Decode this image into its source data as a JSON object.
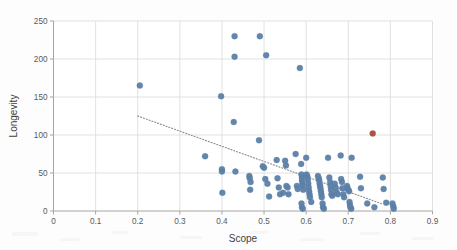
{
  "chart_data": {
    "type": "scatter",
    "title": "",
    "xlabel": "Scope",
    "ylabel": "Longevity",
    "xlim": [
      0,
      0.9
    ],
    "ylim": [
      0,
      250
    ],
    "xticks": [
      0,
      0.1,
      0.2,
      0.3,
      0.4,
      0.5,
      0.6,
      0.7,
      0.8,
      0.9
    ],
    "xtick_labels": [
      "0",
      "0.1",
      "0.2",
      "0.3",
      "0.4",
      "0.5",
      "0.6",
      "0.7",
      "0.8",
      "0.9"
    ],
    "yticks": [
      0,
      50,
      100,
      150,
      200,
      250
    ],
    "ytick_labels": [
      "0",
      "50",
      "100",
      "150",
      "200",
      "250"
    ],
    "grid": true,
    "legend": "none",
    "marker_color": "#5b7fa8",
    "highlight_color": "#a84b3c",
    "trendline": {
      "style": "dotted",
      "color": "#8a8a8a",
      "x_start": 0.2,
      "y_start": 125,
      "x_end": 0.782,
      "y_end": 9
    },
    "series": [
      {
        "name": "observations",
        "color": "#5b7fa8",
        "points": [
          [
            0.205,
            165
          ],
          [
            0.36,
            72
          ],
          [
            0.398,
            151
          ],
          [
            0.4,
            55
          ],
          [
            0.4,
            52
          ],
          [
            0.401,
            24
          ],
          [
            0.43,
            230
          ],
          [
            0.43,
            203
          ],
          [
            0.428,
            117
          ],
          [
            0.432,
            52
          ],
          [
            0.465,
            46
          ],
          [
            0.466,
            43
          ],
          [
            0.468,
            38
          ],
          [
            0.467,
            28
          ],
          [
            0.49,
            230
          ],
          [
            0.488,
            93
          ],
          [
            0.497,
            59
          ],
          [
            0.5,
            57
          ],
          [
            0.505,
            205
          ],
          [
            0.503,
            42
          ],
          [
            0.508,
            36
          ],
          [
            0.512,
            19
          ],
          [
            0.53,
            67
          ],
          [
            0.532,
            43
          ],
          [
            0.535,
            31
          ],
          [
            0.538,
            22
          ],
          [
            0.545,
            24
          ],
          [
            0.55,
            66
          ],
          [
            0.552,
            60
          ],
          [
            0.553,
            33
          ],
          [
            0.556,
            31
          ],
          [
            0.558,
            22
          ],
          [
            0.575,
            75
          ],
          [
            0.578,
            33
          ],
          [
            0.58,
            29
          ],
          [
            0.585,
            188
          ],
          [
            0.588,
            62
          ],
          [
            0.589,
            48
          ],
          [
            0.59,
            44
          ],
          [
            0.59,
            40
          ],
          [
            0.591,
            36
          ],
          [
            0.592,
            33
          ],
          [
            0.593,
            28
          ],
          [
            0.589,
            10
          ],
          [
            0.59,
            5
          ],
          [
            0.592,
            3
          ],
          [
            0.6,
            70
          ],
          [
            0.601,
            48
          ],
          [
            0.603,
            45
          ],
          [
            0.604,
            41
          ],
          [
            0.605,
            36
          ],
          [
            0.606,
            31
          ],
          [
            0.607,
            26
          ],
          [
            0.608,
            22
          ],
          [
            0.609,
            18
          ],
          [
            0.612,
            12
          ],
          [
            0.628,
            46
          ],
          [
            0.63,
            43
          ],
          [
            0.631,
            40
          ],
          [
            0.632,
            36
          ],
          [
            0.633,
            33
          ],
          [
            0.634,
            30
          ],
          [
            0.635,
            26
          ],
          [
            0.636,
            22
          ],
          [
            0.637,
            18
          ],
          [
            0.639,
            10
          ],
          [
            0.64,
            5
          ],
          [
            0.642,
            3
          ],
          [
            0.652,
            70
          ],
          [
            0.655,
            44
          ],
          [
            0.657,
            38
          ],
          [
            0.658,
            33
          ],
          [
            0.659,
            28
          ],
          [
            0.66,
            22
          ],
          [
            0.662,
            20
          ],
          [
            0.668,
            36
          ],
          [
            0.67,
            31
          ],
          [
            0.672,
            25
          ],
          [
            0.675,
            22
          ],
          [
            0.682,
            73
          ],
          [
            0.683,
            42
          ],
          [
            0.685,
            38
          ],
          [
            0.686,
            30
          ],
          [
            0.688,
            22
          ],
          [
            0.69,
            18
          ],
          [
            0.697,
            33
          ],
          [
            0.698,
            30
          ],
          [
            0.7,
            28
          ],
          [
            0.702,
            26
          ],
          [
            0.703,
            12
          ],
          [
            0.704,
            8
          ],
          [
            0.705,
            5
          ],
          [
            0.708,
            70
          ],
          [
            0.707,
            3
          ],
          [
            0.728,
            45
          ],
          [
            0.73,
            30
          ],
          [
            0.745,
            10
          ],
          [
            0.762,
            5
          ],
          [
            0.782,
            44
          ],
          [
            0.784,
            29
          ],
          [
            0.79,
            11
          ],
          [
            0.805,
            10
          ],
          [
            0.807,
            6
          ],
          [
            0.808,
            3
          ]
        ]
      },
      {
        "name": "highlighted-observation",
        "color": "#a84b3c",
        "points": [
          [
            0.758,
            102
          ]
        ]
      }
    ]
  },
  "axes": {
    "x_title": "Scope",
    "y_title": "Longevity"
  }
}
